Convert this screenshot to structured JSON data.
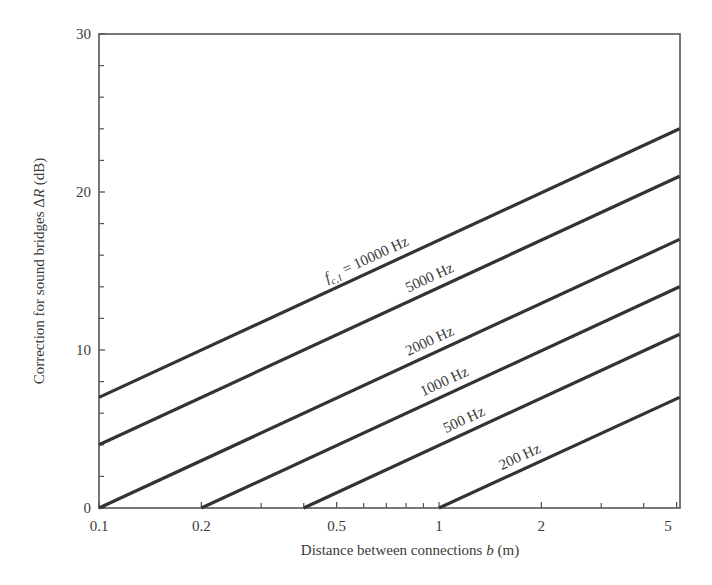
{
  "chart_data": {
    "type": "line",
    "title": "",
    "xlabel": "Distance between connections b (m)",
    "xlabel_parts": {
      "before": "Distance between connections ",
      "italic": "b",
      "after": " (m)"
    },
    "ylabel": "Correction for sound bridges ΔR (dB)",
    "ylabel_parts": {
      "before": "Correction for sound bridges Δ",
      "italic": "R",
      "after": " (dB)"
    },
    "xscale": "log",
    "xlim": [
      0.1,
      5.1
    ],
    "ylim": [
      0,
      30
    ],
    "grid": false,
    "legend": "inline labels on lines",
    "x_ticks_major": [
      {
        "value": 0.1,
        "label": "0.1"
      },
      {
        "value": 0.2,
        "label": "0.2"
      },
      {
        "value": 0.5,
        "label": "0.5"
      },
      {
        "value": 1,
        "label": "1"
      },
      {
        "value": 2,
        "label": "2"
      },
      {
        "value": 5,
        "label": "5"
      }
    ],
    "x_ticks_minor": [
      0.3,
      0.4,
      0.6,
      0.7,
      0.8,
      0.9,
      3,
      4
    ],
    "y_ticks_major": [
      {
        "value": 0,
        "label": "0"
      },
      {
        "value": 10,
        "label": "10"
      },
      {
        "value": 20,
        "label": "20"
      },
      {
        "value": 30,
        "label": "30"
      }
    ],
    "y_ticks_minor": [
      2,
      4,
      6,
      8,
      12,
      14,
      16,
      18,
      22,
      24,
      26,
      28
    ],
    "series": [
      {
        "name": "f_c,1 = 10000 Hz",
        "label": "= 10000 Hz",
        "label_prefix": "f",
        "label_sub": "c,1",
        "x": [
          0.1,
          5.1
        ],
        "values": [
          7,
          24
        ],
        "label_at_b": 0.62
      },
      {
        "name": "5000 Hz",
        "label": "5000 Hz",
        "x": [
          0.1,
          5.1
        ],
        "values": [
          4,
          21
        ],
        "label_at_b": 0.95
      },
      {
        "name": "2000 Hz",
        "label": "2000 Hz",
        "x": [
          0.1,
          5.1
        ],
        "values": [
          0,
          17
        ],
        "label_at_b": 0.95
      },
      {
        "name": "1000 Hz",
        "label": "1000 Hz",
        "x": [
          0.2,
          5.1
        ],
        "values": [
          0,
          14
        ],
        "label_at_b": 1.05
      },
      {
        "name": "500 Hz",
        "label": "500 Hz",
        "x": [
          0.4,
          5.1
        ],
        "values": [
          0,
          11
        ],
        "label_at_b": 1.2
      },
      {
        "name": "200 Hz",
        "label": "200 Hz",
        "x": [
          1.0,
          5.1
        ],
        "values": [
          0,
          7
        ],
        "label_at_b": 1.75
      }
    ],
    "colors": {
      "line": "#333333",
      "axis": "#555555",
      "text": "#3a3a3a"
    }
  },
  "layout": {
    "plot": {
      "left": 99,
      "right": 680,
      "top": 34,
      "bottom": 508
    },
    "decade_px": 340
  }
}
